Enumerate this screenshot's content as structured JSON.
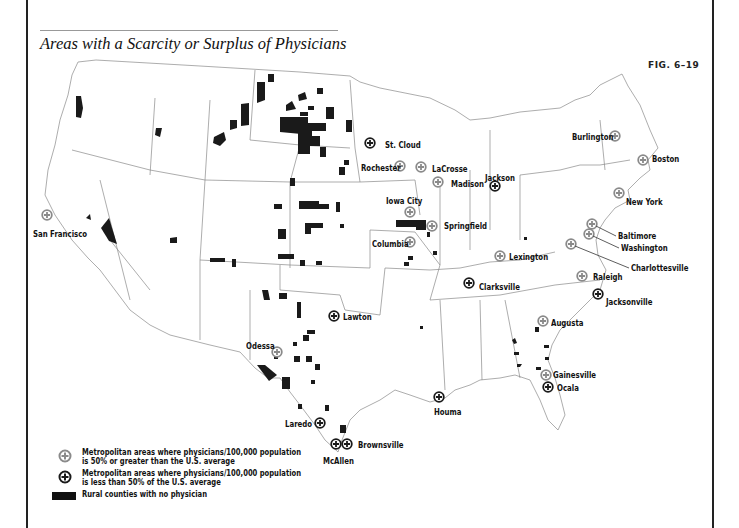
{
  "header": {
    "title": "Areas with a Scarcity or Surplus of Physicians",
    "figure_label": "FIG. 6–19"
  },
  "colors": {
    "surplus_marker": "#8a8a8a",
    "scarcity_marker": "#1a1a1a",
    "rural_fill": "#1a1a1a",
    "border": "#777777"
  },
  "legend": {
    "items": [
      {
        "icon": "gray-cross-circle-icon",
        "text": "Metropolitan areas where physicians/100,000 population\nis 50% or greater than the U.S. average"
      },
      {
        "icon": "black-cross-circle-icon",
        "text": "Metropolitan areas where physicians/100,000 population\nis less than 50% of the U.S. average"
      },
      {
        "icon": "black-rectangle-swatch",
        "text": "Rural counties with no physician"
      }
    ]
  },
  "cities": [
    {
      "name": "San Francisco",
      "type": "surplus",
      "mx": 47,
      "my": 215,
      "lx": 33,
      "ly": 229
    },
    {
      "name": "St. Cloud",
      "type": "scarcity",
      "mx": 370,
      "my": 143,
      "lx": 385,
      "ly": 140
    },
    {
      "name": "Rochester",
      "type": "surplus",
      "mx": 400,
      "my": 166,
      "lx": 361,
      "ly": 163
    },
    {
      "name": "LaCrosse",
      "type": "surplus",
      "mx": 421,
      "my": 167,
      "lx": 432,
      "ly": 164
    },
    {
      "name": "Madison",
      "type": "surplus",
      "mx": 438,
      "my": 182,
      "lx": 451,
      "ly": 179
    },
    {
      "name": "Jackson",
      "type": "scarcity",
      "mx": 495,
      "my": 186,
      "lx": 485,
      "ly": 173
    },
    {
      "name": "Burlington",
      "type": "surplus",
      "mx": 615,
      "my": 136,
      "lx": 572,
      "ly": 132
    },
    {
      "name": "Boston",
      "type": "surplus",
      "mx": 643,
      "my": 160,
      "lx": 652,
      "ly": 154
    },
    {
      "name": "New York",
      "type": "surplus",
      "mx": 619,
      "my": 193,
      "lx": 626,
      "ly": 197
    },
    {
      "name": "Iowa City",
      "type": "surplus",
      "mx": 410,
      "my": 212,
      "lx": 386,
      "ly": 196
    },
    {
      "name": "Springfield",
      "type": "surplus",
      "mx": 432,
      "my": 226,
      "lx": 444,
      "ly": 221
    },
    {
      "name": "Columbia",
      "type": "surplus",
      "mx": 410,
      "my": 242,
      "lx": 372,
      "ly": 239
    },
    {
      "name": "Baltimore",
      "type": "surplus",
      "mx": 592,
      "my": 224,
      "lx": 618,
      "ly": 231
    },
    {
      "name": "Washington",
      "type": "surplus",
      "mx": 589,
      "my": 234,
      "lx": 621,
      "ly": 243
    },
    {
      "name": "Charlottesville",
      "type": "surplus",
      "mx": 571,
      "my": 244,
      "lx": 631,
      "ly": 263
    },
    {
      "name": "Lexington",
      "type": "surplus",
      "mx": 500,
      "my": 256,
      "lx": 509,
      "ly": 252
    },
    {
      "name": "Raleigh",
      "type": "surplus",
      "mx": 582,
      "my": 276,
      "lx": 593,
      "ly": 272
    },
    {
      "name": "Clarksville",
      "type": "scarcity",
      "mx": 469,
      "my": 283,
      "lx": 479,
      "ly": 282
    },
    {
      "name": "Jacksonville",
      "type": "scarcity",
      "mx": 598,
      "my": 294,
      "lx": 606,
      "ly": 297
    },
    {
      "name": "Lawton",
      "type": "scarcity",
      "mx": 334,
      "my": 316,
      "lx": 343,
      "ly": 312
    },
    {
      "name": "Augusta",
      "type": "surplus",
      "mx": 543,
      "my": 321,
      "lx": 551,
      "ly": 318
    },
    {
      "name": "Odessa",
      "type": "surplus",
      "mx": 277,
      "my": 352,
      "lx": 246,
      "ly": 341
    },
    {
      "name": "Gainesville",
      "type": "surplus",
      "mx": 546,
      "my": 375,
      "lx": 553,
      "ly": 370
    },
    {
      "name": "Ocala",
      "type": "scarcity",
      "mx": 548,
      "my": 387,
      "lx": 557,
      "ly": 383
    },
    {
      "name": "Houma",
      "type": "scarcity",
      "mx": 439,
      "my": 397,
      "lx": 434,
      "ly": 407
    },
    {
      "name": "Laredo",
      "type": "scarcity",
      "mx": 320,
      "my": 423,
      "lx": 285,
      "ly": 419
    },
    {
      "name": "McAllen",
      "type": "scarcity",
      "mx": 336,
      "my": 444,
      "lx": 323,
      "ly": 456
    },
    {
      "name": "Brownsville",
      "type": "scarcity",
      "mx": 347,
      "my": 444,
      "lx": 358,
      "ly": 440
    }
  ],
  "rural_counties": [
    "M76,96 l5,0 l2,12 l-2,10 l-5,-1 z",
    "M156,128 l6,0 l-2,9 l-5,-2 z",
    "M170,238 l7,-1 l0,6 l-7,0 z",
    "M101,228 l8,-10 l8,26 l-8,-3 z",
    "M86,218 l4,-4 l1,6 z",
    "M214,137 l10,-5 l2,8 l-6,6 l-7,-3 z",
    "M230,120 l7,0 l0,8 l-7,2 z",
    "M241,104 l8,-1 l0,22 l-8,1 z",
    "M257,82 l8,0 l0,18 l-8,3 z",
    "M268,74 l6,0 l0,8 l-6,0 z",
    "M298,95 l7,-3 l2,7 l-8,2 z",
    "M280,117 l28,0 l0,6 l18,0 l0,8 l-14,0 l0,4 l-32,-3 z",
    "M286,105 l6,-4 l4,8 l-10,2 z",
    "M300,112 l8,0 l0,4 l-8,0 z",
    "M308,106 l6,0 l0,4 l-6,0 z",
    "M326,107 l8,0 l0,12 l-8,0 z",
    "M317,88 l6,0 l0,6 l-6,0 z",
    "M298,130 l14,0 l0,6 l8,0 l0,10 l-10,0 l0,8 l-12,0 z",
    "M346,120 l6,0 l0,12 l-6,0 z",
    "M320,147 l6,0 l0,10 l-6,0 z",
    "M339,167 l6,0 l0,8 l-6,0 z",
    "M344,160 l5,0 l0,5 l-5,0 z",
    "M290,178 l5,0 l0,8 l-5,0 z",
    "M299,201 l20,0 l0,3 l10,0 l0,5 l-30,0 z",
    "M336,202 l4,0 l0,10 l-4,0 z",
    "M274,204 l8,0 l0,5 l-8,0 z",
    "M305,223 l18,0 l0,5 l-12,0 l0,6 l-6,0 z",
    "M340,224 l4,0 l0,4 l-4,0 z",
    "M278,229 l8,0 l0,10 l-8,0 z",
    "M278,254 l16,0 l0,5 l-16,0 z",
    "M210,258 l15,0 l0,4 l-15,0 z",
    "M232,259 l4,0 l0,8 l-4,0 z",
    "M300,260 l5,0 l0,6 l-5,0 z",
    "M316,261 l6,0 l0,4 l-6,0 z",
    "M396,220 l30,0 l0,10 l-10,0 l0,-3 l-20,0 z",
    "M408,256 l5,0 l0,4 l-5,0 z",
    "M404,262 l5,0 l0,4 l-5,0 z",
    "M427,232 l3,0 l0,5 l-3,0 z",
    "M433,251 l4,0 l0,4 l-4,0 z",
    "M262,290 l6,0 l2,10 l-6,0 z",
    "M279,293 l8,0 l0,6 l-8,0 z",
    "M297,302 l4,0 l0,16 l-4,0 z",
    "M307,330 l8,0 l0,4 l-8,0 z",
    "M303,335 l6,0 l0,6 l-6,0 z",
    "M293,342 l4,0 l0,4 l-4,0 z",
    "M294,356 l6,0 l0,6 l-6,0 z",
    "M306,356 l6,0 l0,6 l-6,0 z",
    "M315,364 l5,0 l0,6 l-5,0 z",
    "M257,365 l8,0 l12,10 l-8,6 z",
    "M282,377 l8,0 l0,12 l-8,0 z",
    "M311,380 l4,0 l0,4 l-4,0 z",
    "M274,355 l4,0 l0,4 l-4,0 z",
    "M325,405 l4,0 l0,6 l-4,0 z",
    "M340,425 l6,0 l0,8 l-6,0 z",
    "M298,404 l4,0 l0,5 l-4,0 z",
    "M420,326 l3,0 l0,3 l-3,0 z",
    "M524,237 l3,0 l0,3 l-3,0 z",
    "M512,340 l3,-2 l2,5 l-3,1 z",
    "M514,352 l5,0 l0,3 l-5,0 z",
    "M517,364 l5,0 l-2,3 l-3,0 z",
    "M535,327 l4,0 l0,5 l-4,0 z",
    "M544,345 l5,0 l0,3 l-5,0 z",
    "M545,357 l4,0 l0,3 l-4,0 z",
    "M536,367 l5,0 l0,3 l-5,0 z"
  ]
}
